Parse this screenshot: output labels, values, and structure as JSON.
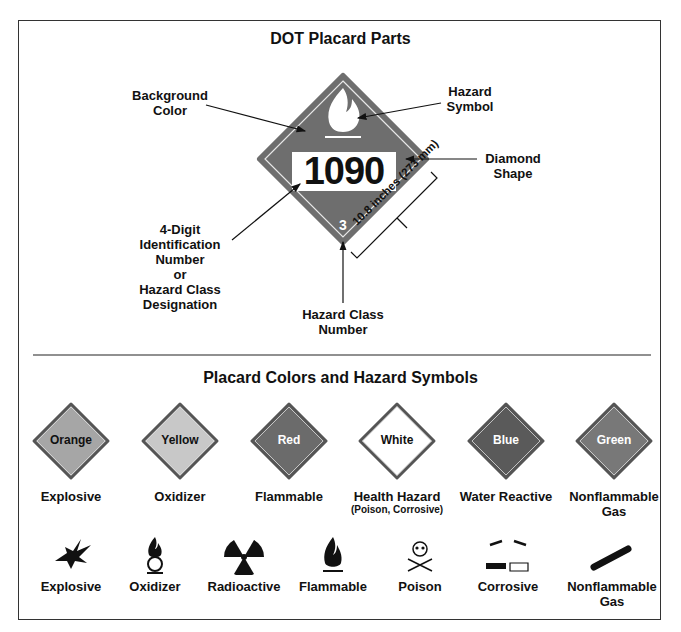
{
  "parts_section": {
    "title": "DOT Placard Parts",
    "placard": {
      "id_number": "1090",
      "class_number": "3",
      "fill": "#6e6e6e"
    },
    "callouts": {
      "background": [
        "Background",
        "Color"
      ],
      "symbol": [
        "Hazard",
        "Symbol"
      ],
      "diamond": [
        "Diamond",
        "Shape"
      ],
      "id_number": [
        "4-Digit",
        "Identification",
        "Number",
        "or",
        "Hazard Class",
        "Designation"
      ],
      "class_number": [
        "Hazard Class",
        "Number"
      ],
      "dimension": "10.8 inches (273 mm)"
    }
  },
  "colors_section": {
    "title": "Placard Colors and Hazard Symbols",
    "placards": [
      {
        "color": "Orange",
        "meaning": "Explosive",
        "sub": "",
        "fill": "#a6a6a6",
        "text": "#111"
      },
      {
        "color": "Yellow",
        "meaning": "Oxidizer",
        "sub": "",
        "fill": "#c8c8c8",
        "text": "#111"
      },
      {
        "color": "Red",
        "meaning": "Flammable",
        "sub": "",
        "fill": "#6b6b6b",
        "text": "#fff"
      },
      {
        "color": "White",
        "meaning": "Health Hazard",
        "sub": "(Poison, Corrosive)",
        "fill": "#ffffff",
        "text": "#111"
      },
      {
        "color": "Blue",
        "meaning": "Water Reactive",
        "sub": "",
        "fill": "#5a5a5a",
        "text": "#fff"
      },
      {
        "color": "Green",
        "meaning": "Nonflammable",
        "sub": "Gas",
        "fill": "#787878",
        "text": "#fff"
      }
    ],
    "symbols": [
      {
        "name": "Explosive",
        "icon": "explosion-icon"
      },
      {
        "name": "Oxidizer",
        "icon": "flame-over-circle-icon"
      },
      {
        "name": "Radioactive",
        "icon": "trefoil-icon"
      },
      {
        "name": "Flammable",
        "icon": "flame-icon"
      },
      {
        "name": "Poison",
        "icon": "skull-crossbones-icon"
      },
      {
        "name": "Corrosive",
        "icon": "corrosion-icon"
      },
      {
        "name": "Nonflammable",
        "name2": "Gas",
        "icon": "gas-cylinder-icon"
      }
    ]
  }
}
